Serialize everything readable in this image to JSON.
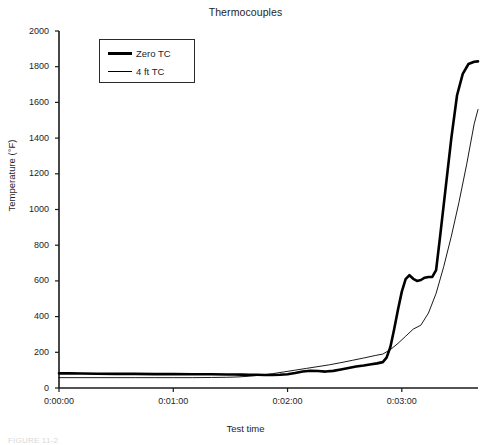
{
  "chart_data": {
    "type": "line",
    "title": "Thermocouples",
    "xlabel": "Test time",
    "ylabel": "Temperature (°F)",
    "grid": false,
    "legend_position": "top-left-inside",
    "ylim": [
      0,
      2000
    ],
    "yticks": [
      0,
      200,
      400,
      600,
      800,
      1000,
      1200,
      1400,
      1600,
      1800,
      2000
    ],
    "ytick_labels": [
      "0",
      "200",
      "400",
      "600",
      "800",
      "1000",
      "1200",
      "1400",
      "1600",
      "1800",
      "2000"
    ],
    "xlim": [
      0,
      220
    ],
    "xticks": [
      0,
      60,
      120,
      180
    ],
    "xtick_labels": [
      "0:00:00",
      "0:01:00",
      "0:02:00",
      "0:03:00"
    ],
    "series": [
      {
        "name": "Zero TC",
        "line_width": 2.6,
        "color": "#000000",
        "x": [
          0,
          5,
          12,
          20,
          30,
          40,
          50,
          60,
          70,
          80,
          88,
          92,
          96,
          100,
          104,
          108,
          112,
          116,
          120,
          124,
          128,
          132,
          136,
          140,
          144,
          148,
          152,
          156,
          160,
          164,
          167,
          170,
          172,
          174,
          176,
          178,
          180,
          182,
          184,
          186,
          188,
          190,
          192,
          194,
          196,
          198,
          200,
          203,
          206,
          209,
          212,
          215,
          218,
          220
        ],
        "y": [
          82,
          82,
          81,
          80,
          79,
          79,
          78,
          78,
          77,
          77,
          76,
          76,
          75,
          74,
          74,
          73,
          73,
          74,
          77,
          84,
          92,
          97,
          95,
          92,
          96,
          104,
          112,
          120,
          126,
          133,
          138,
          145,
          170,
          230,
          330,
          440,
          540,
          610,
          632,
          612,
          600,
          605,
          618,
          622,
          622,
          660,
          840,
          1120,
          1400,
          1640,
          1760,
          1815,
          1828,
          1830
        ]
      },
      {
        "name": "4 ft TC",
        "line_width": 0.9,
        "color": "#000000",
        "x": [
          0,
          10,
          20,
          30,
          40,
          50,
          60,
          70,
          80,
          88,
          94,
          100,
          106,
          112,
          118,
          124,
          130,
          136,
          142,
          148,
          154,
          160,
          166,
          170,
          174,
          178,
          182,
          186,
          190,
          194,
          198,
          202,
          206,
          210,
          214,
          218,
          220
        ],
        "y": [
          58,
          58,
          58,
          58,
          58,
          58,
          58,
          58,
          59,
          60,
          62,
          66,
          72,
          80,
          90,
          100,
          110,
          120,
          130,
          142,
          155,
          168,
          182,
          190,
          215,
          250,
          290,
          330,
          352,
          420,
          530,
          680,
          850,
          1040,
          1250,
          1480,
          1560
        ]
      }
    ],
    "annotations": []
  },
  "legend": {
    "items": [
      {
        "label": "Zero TC",
        "line_width": 3
      },
      {
        "label": "4 ft TC",
        "line_width": 1
      }
    ]
  },
  "caption": {
    "ghost_text": "FIGURE 11-2"
  }
}
